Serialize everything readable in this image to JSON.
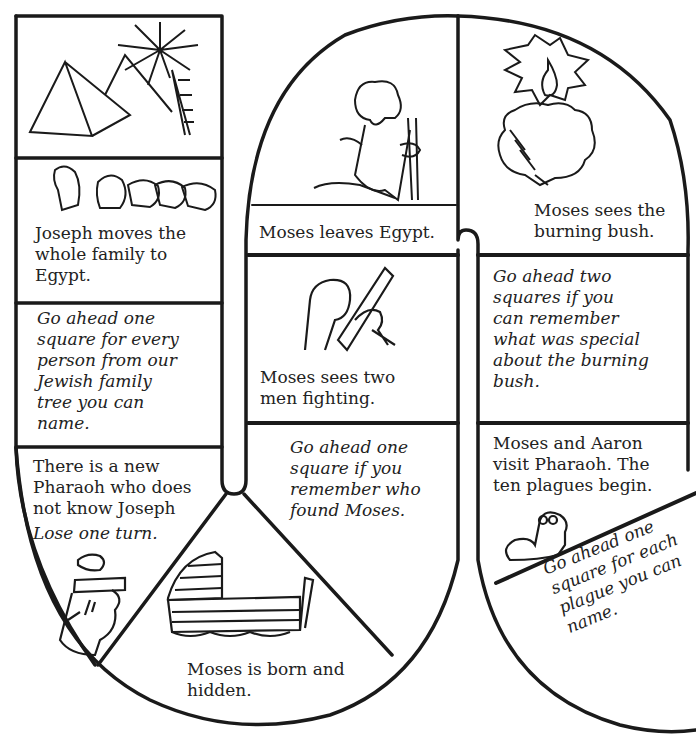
{
  "board": {
    "ink_color": "#1a1a1a",
    "paper_color": "#ffffff",
    "squares": [
      {
        "id": "egypt-pyramids",
        "text": "",
        "illustration": "pyramids-and-palm-tree"
      },
      {
        "id": "joseph-family",
        "text": "Joseph moves the\nwhole family to\nEgypt.",
        "illustration": "family-faces"
      },
      {
        "id": "family-tree",
        "text": "Go ahead one\nsquare for every\nperson from our\nJewish family\ntree you can\nname.",
        "style": "italic"
      },
      {
        "id": "new-pharaoh",
        "text": "There is a new\nPharaoh who does\nnot know Joseph",
        "action": "Lose one turn.",
        "illustration": "pharaoh-face"
      },
      {
        "id": "moses-born",
        "text": "Moses is born and\nhidden.",
        "illustration": "basket-in-reeds"
      },
      {
        "id": "who-found-moses",
        "text": "Go ahead one\nsquare if you\nremember who\nfound Moses.",
        "style": "italic"
      },
      {
        "id": "two-men-fighting",
        "text": "Moses sees two\nmen fighting.",
        "illustration": "fist-and-stick"
      },
      {
        "id": "moses-leaves",
        "text": "Moses leaves Egypt.",
        "illustration": "moses-kneeling-with-staff"
      },
      {
        "id": "burning-bush",
        "text": "Moses sees the\nburning bush.",
        "illustration": "burning-bush"
      },
      {
        "id": "remember-bush",
        "text": "Go ahead two\nsquares if you\ncan remember\nwhat was special\nabout the burning\nbush.",
        "style": "italic"
      },
      {
        "id": "ten-plagues",
        "text": "Moses and Aaron\nvisit Pharaoh. The\nten plagues begin.",
        "illustration": "frog"
      },
      {
        "id": "name-plagues",
        "text": "Go ahead one\nsquare for each\nplague you can\nname.",
        "style": "italic"
      }
    ]
  }
}
